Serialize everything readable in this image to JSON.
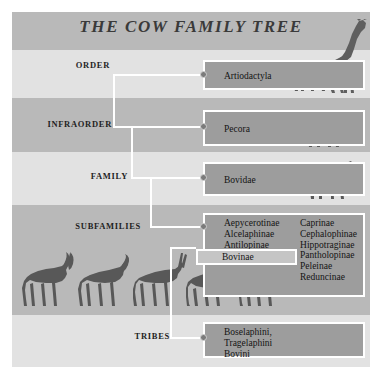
{
  "poster": {
    "title": "THE COW FAMILY TREE",
    "background_color": "#ffffff",
    "band_dark_color": "#b9b9b9",
    "band_light_color": "#e2e2e2",
    "node_color": "#9d9d9d",
    "connector_color": "#ffffff",
    "silhouette_color": "#5f5f5f"
  },
  "ranks": {
    "order": "ORDER",
    "infraorder": "INFRAORDER",
    "family": "FAMILY",
    "subfamilies": "SUBFAMILIES",
    "tribes": "TRIBES"
  },
  "nodes": {
    "order": {
      "label": "Artiodactyla"
    },
    "infraorder": {
      "label": "Pecora"
    },
    "family": {
      "label": "Bovidae"
    },
    "subfamilies": {
      "column_left": [
        "Aepycerotinae",
        "Alcelaphinae",
        "Antilopinae"
      ],
      "highlight": "Bovinae",
      "column_right": [
        "Caprinae",
        "Cephalophinae",
        "Hippotraginae",
        "Pantholopinae",
        "Peleinae",
        "Reduncinae"
      ]
    },
    "tribes": {
      "lines": [
        "Boselaphini,",
        "Tragelaphini",
        "Bovini"
      ]
    }
  },
  "silhouettes": {
    "order_row": [
      "bison-silhouette",
      "giraffe-silhouette"
    ],
    "infraorder_row": [
      "deer-silhouette"
    ],
    "family_row": [
      "wildebeest-silhouette"
    ],
    "subfamilies_row": [
      "kudu-silhouette",
      "sable-antelope-silhouette",
      "oryx-silhouette",
      "buffalo-silhouette",
      "gazelle-silhouette"
    ]
  }
}
